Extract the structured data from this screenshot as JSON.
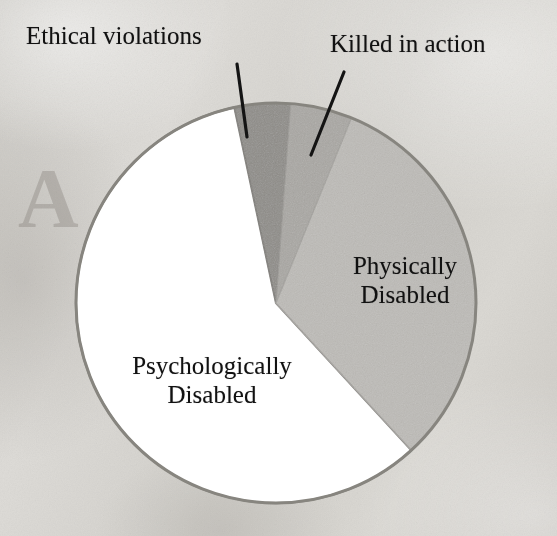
{
  "figure": {
    "kind": "pie-chart",
    "background_color": "#d8d6d2",
    "outline_color": "#8c8a86"
  },
  "labels": {
    "ethical": "Ethical violations",
    "killed": "Killed in action",
    "physical_line1": "Physically",
    "physical_line2": "Disabled",
    "psychological_line1": "Psychologically",
    "psychological_line2": "Disabled"
  },
  "chart_data": {
    "type": "pie",
    "title": "",
    "categories": [
      "Ethical violations",
      "Killed in action",
      "Physically Disabled",
      "Psychologically Disabled"
    ],
    "values": [
      4.5,
      5.0,
      32.0,
      58.5
    ],
    "unit": "percent",
    "start_angle_deg": -12,
    "direction": "clockwise",
    "legend": "none",
    "labels_position": "inside-and-callout",
    "callout_leader_lines": [
      "Ethical violations",
      "Killed in action"
    ],
    "slice_colors": [
      "#8e8c88",
      "#a9a7a3",
      "#bdbbb7",
      "#ffffff"
    ],
    "slice_boundaries_deg_from_top": [
      -12,
      4,
      22,
      137
    ],
    "grid": false,
    "xlabel": "",
    "ylabel": ""
  },
  "geometry": {
    "center_x": 276,
    "center_y": 303,
    "radius": 200
  }
}
